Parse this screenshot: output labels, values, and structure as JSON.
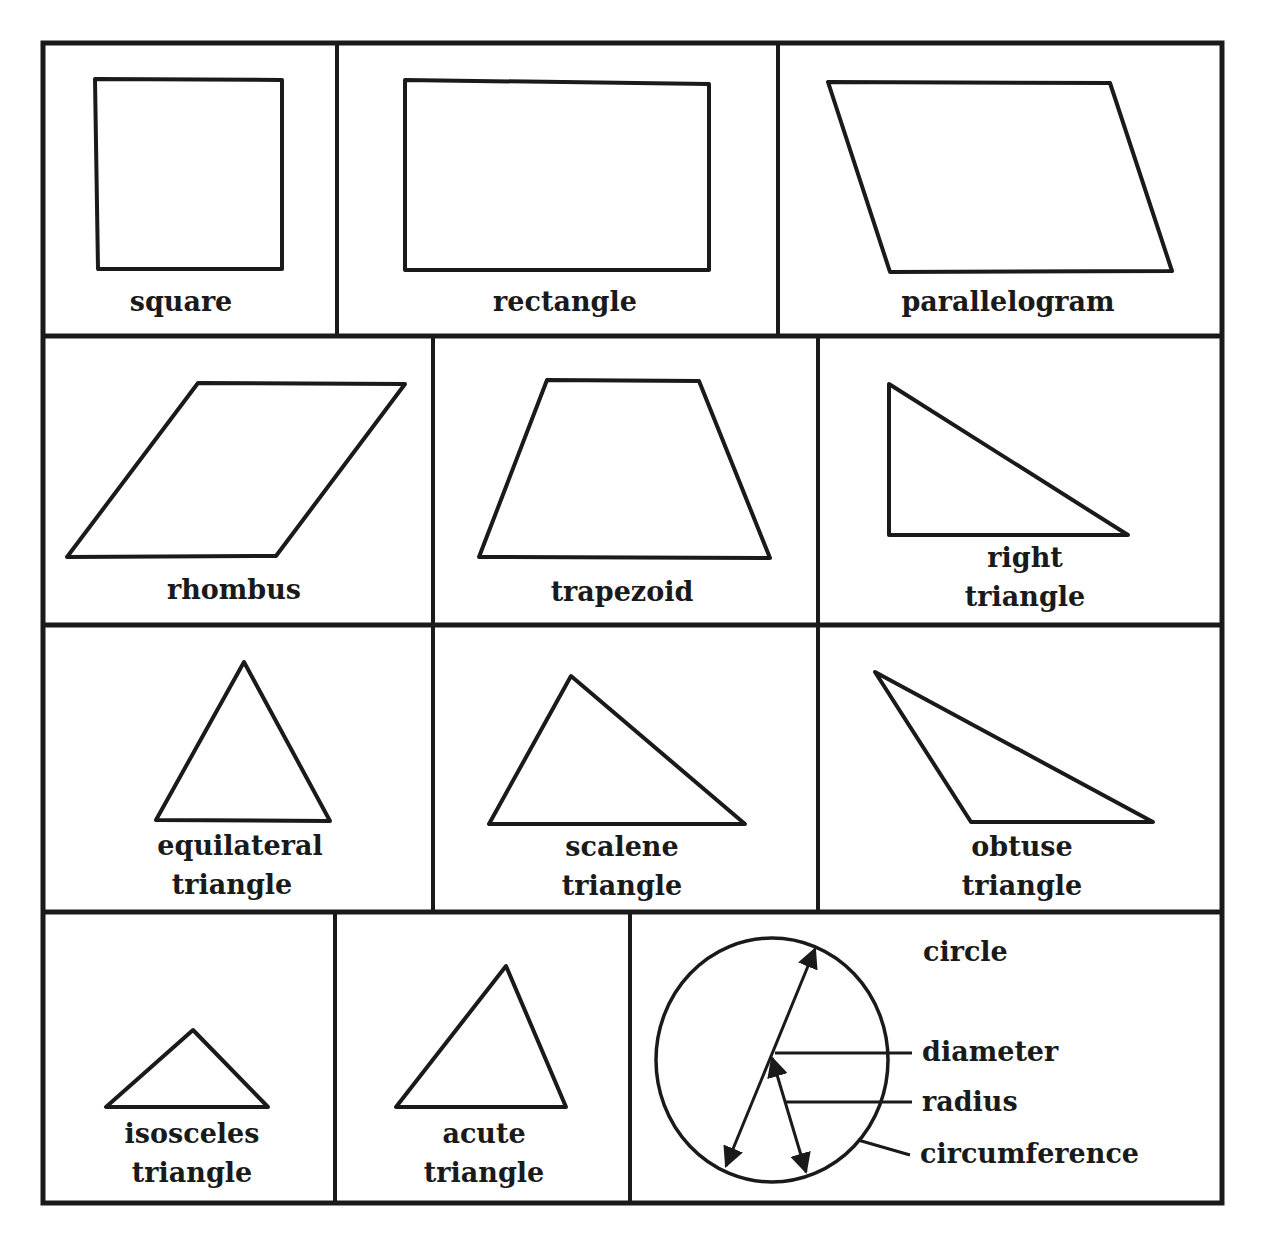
{
  "colors": {
    "ink": "#1a1a1a",
    "paper": "#ffffff"
  },
  "rows": [
    {
      "cells": [
        {
          "id": "square",
          "label_lines": [
            "square"
          ]
        },
        {
          "id": "rectangle",
          "label_lines": [
            "rectangle"
          ]
        },
        {
          "id": "parallelogram",
          "label_lines": [
            "parallelogram"
          ]
        }
      ]
    },
    {
      "cells": [
        {
          "id": "rhombus",
          "label_lines": [
            "rhombus"
          ]
        },
        {
          "id": "trapezoid",
          "label_lines": [
            "trapezoid"
          ]
        },
        {
          "id": "right-triangle",
          "label_lines": [
            "right",
            "triangle"
          ]
        }
      ]
    },
    {
      "cells": [
        {
          "id": "equilateral-triangle",
          "label_lines": [
            "equilateral",
            "triangle"
          ]
        },
        {
          "id": "scalene-triangle",
          "label_lines": [
            "scalene",
            "triangle"
          ]
        },
        {
          "id": "obtuse-triangle",
          "label_lines": [
            "obtuse",
            "triangle"
          ]
        }
      ]
    },
    {
      "cells": [
        {
          "id": "isosceles-triangle",
          "label_lines": [
            "isosceles",
            "triangle"
          ]
        },
        {
          "id": "acute-triangle",
          "label_lines": [
            "acute",
            "triangle"
          ]
        },
        {
          "id": "circle",
          "label_lines": [
            "circle"
          ],
          "callouts": [
            "diameter",
            "radius",
            "circumference"
          ]
        }
      ]
    }
  ]
}
